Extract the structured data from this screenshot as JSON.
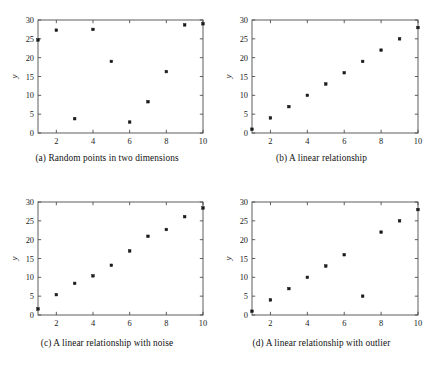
{
  "figure": {
    "background": "#ffffff",
    "axis_color": "#4d4d4d",
    "marker_color": "#1a1a1a",
    "panel_count": 4
  },
  "panels": [
    {
      "key": "a",
      "caption": "(a) Random points in two dimensions",
      "chart_data": {
        "type": "scatter",
        "title": "",
        "xlabel": "x",
        "ylabel": "y",
        "xlim": [
          1,
          10
        ],
        "ylim": [
          0,
          30
        ],
        "xticks": [
          2,
          4,
          6,
          8,
          10
        ],
        "yticks": [
          0,
          5,
          10,
          15,
          20,
          25,
          30
        ],
        "grid": false,
        "legend": "none",
        "x": [
          1,
          2,
          3,
          4,
          5,
          6,
          7,
          8,
          9,
          10
        ],
        "values": [
          24.7,
          27.3,
          3.8,
          27.5,
          19.0,
          2.9,
          8.3,
          16.3,
          28.7,
          29.0
        ]
      }
    },
    {
      "key": "b",
      "caption": "(b) A linear relationship",
      "chart_data": {
        "type": "scatter",
        "title": "",
        "xlabel": "x",
        "ylabel": "y",
        "xlim": [
          1,
          10
        ],
        "ylim": [
          0,
          30
        ],
        "xticks": [
          2,
          4,
          6,
          8,
          10
        ],
        "yticks": [
          0,
          5,
          10,
          15,
          20,
          25,
          30
        ],
        "grid": false,
        "legend": "none",
        "x": [
          1,
          2,
          3,
          4,
          5,
          6,
          7,
          8,
          9,
          10
        ],
        "values": [
          1,
          4,
          7,
          10,
          13,
          16,
          19,
          22,
          25,
          28
        ]
      }
    },
    {
      "key": "c",
      "caption": "(c) A linear relationship with noise",
      "chart_data": {
        "type": "scatter",
        "title": "",
        "xlabel": "x",
        "ylabel": "y",
        "xlim": [
          1,
          10
        ],
        "ylim": [
          0,
          30
        ],
        "xticks": [
          2,
          4,
          6,
          8,
          10
        ],
        "yticks": [
          0,
          5,
          10,
          15,
          20,
          25,
          30
        ],
        "grid": false,
        "legend": "none",
        "x": [
          1,
          2,
          3,
          4,
          5,
          6,
          7,
          8,
          9,
          10
        ],
        "values": [
          1.6,
          5.4,
          8.4,
          10.4,
          13.2,
          17.0,
          20.9,
          22.7,
          26.1,
          28.4
        ]
      }
    },
    {
      "key": "d",
      "caption": "(d) A linear relationship with outlier",
      "chart_data": {
        "type": "scatter",
        "title": "",
        "xlabel": "x",
        "ylabel": "y",
        "xlim": [
          1,
          10
        ],
        "ylim": [
          0,
          30
        ],
        "xticks": [
          2,
          4,
          6,
          8,
          10
        ],
        "yticks": [
          0,
          5,
          10,
          15,
          20,
          25,
          30
        ],
        "grid": false,
        "legend": "none",
        "x": [
          1,
          2,
          3,
          4,
          5,
          6,
          7,
          8,
          9,
          10
        ],
        "values": [
          1,
          4,
          7,
          10,
          13,
          16,
          5,
          22,
          25,
          28
        ]
      }
    }
  ]
}
